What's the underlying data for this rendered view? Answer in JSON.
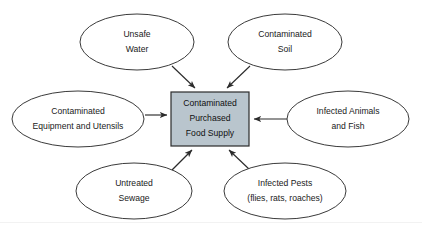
{
  "diagram": {
    "type": "hub-and-spoke-cause-diagram",
    "colors": {
      "center_fill": "#b9c5cd",
      "center_stroke": "#2b2b2b",
      "node_fill": "#ffffff",
      "node_stroke": "#3a3a3a",
      "edge_stroke": "#2b2b2b",
      "background": "#ffffff"
    },
    "center": {
      "name": "contaminated-purchased-food-supply",
      "line1": "Contaminated",
      "line2": "Purchased",
      "line3": "Food Supply",
      "shape": "rectangle"
    },
    "nodes": [
      {
        "name": "unsafe-water",
        "line1": "Unsafe",
        "line2": "Water",
        "line3": "",
        "position": "top-left",
        "cx": 137,
        "cy": 42,
        "rx": 57,
        "ry": 28
      },
      {
        "name": "contaminated-soil",
        "line1": "Contaminated",
        "line2": "Soil",
        "line3": "",
        "position": "top-right",
        "cx": 285,
        "cy": 42,
        "rx": 57,
        "ry": 28
      },
      {
        "name": "contaminated-equipment-and-utensils",
        "line1": "Contaminated",
        "line2": "Equipment and Utensils",
        "line3": "",
        "position": "left",
        "cx": 78,
        "cy": 119,
        "rx": 66,
        "ry": 28
      },
      {
        "name": "infected-animals-and-fish",
        "line1": "Infected Animals",
        "line2": "and Fish",
        "line3": "",
        "position": "right",
        "cx": 348,
        "cy": 119,
        "rx": 61,
        "ry": 28
      },
      {
        "name": "untreated-sewage",
        "line1": "Untreated",
        "line2": "Sewage",
        "line3": "",
        "position": "bottom-left",
        "cx": 134,
        "cy": 191,
        "rx": 58,
        "ry": 28
      },
      {
        "name": "infected-pests",
        "line1": "Infected Pests",
        "line2": "(flies, rats, roaches)",
        "line3": "",
        "position": "bottom-right",
        "cx": 285,
        "cy": 191,
        "rx": 61,
        "ry": 28
      }
    ],
    "edges": [
      {
        "name": "edge-unsafe-water-to-center",
        "from": "unsafe-water",
        "to": "contaminated-purchased-food-supply",
        "direction": "to-center"
      },
      {
        "name": "edge-contaminated-soil-to-center",
        "from": "contaminated-soil",
        "to": "contaminated-purchased-food-supply",
        "direction": "to-center"
      },
      {
        "name": "edge-contaminated-equipment-to-center",
        "from": "contaminated-equipment-and-utensils",
        "to": "contaminated-purchased-food-supply",
        "direction": "to-center"
      },
      {
        "name": "edge-infected-animals-to-center",
        "from": "infected-animals-and-fish",
        "to": "contaminated-purchased-food-supply",
        "direction": "to-center"
      },
      {
        "name": "edge-untreated-sewage-to-center",
        "from": "untreated-sewage",
        "to": "contaminated-purchased-food-supply",
        "direction": "to-center"
      },
      {
        "name": "edge-infected-pests-to-center",
        "from": "infected-pests",
        "to": "contaminated-purchased-food-supply",
        "direction": "to-center"
      }
    ]
  }
}
